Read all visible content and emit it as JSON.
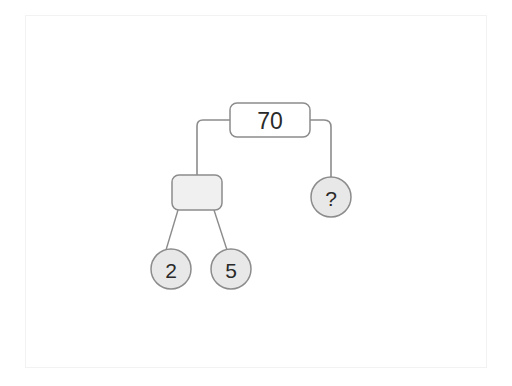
{
  "diagram": {
    "type": "tree-diagram",
    "title_text": "",
    "colors": {
      "page_background": "#ffffff",
      "frame_border": "#f2f2f2",
      "node_stroke": "#8c8c8c",
      "connector_stroke": "#8c8c8c",
      "root_fill": "#ffffff",
      "box_fill": "#f0f0f0",
      "circle_fill": "#e8e8e8",
      "text_color": "#2a2a2a"
    },
    "nodes": {
      "root": {
        "label": "70",
        "shape": "rounded-rectangle",
        "fill": "#ffffff",
        "x": 230,
        "y": 103,
        "width": 80,
        "height": 34
      },
      "operator_box": {
        "label": "",
        "shape": "rounded-rectangle",
        "fill": "#f0f0f0",
        "x": 172,
        "y": 175,
        "width": 50,
        "height": 35
      },
      "unknown": {
        "label": "?",
        "shape": "circle",
        "fill": "#e8e8e8",
        "cx": 331,
        "cy": 197,
        "r": 20
      },
      "leaf_left": {
        "label": "2",
        "shape": "circle",
        "fill": "#e8e8e8",
        "cx": 171,
        "cy": 269,
        "r": 20
      },
      "leaf_right": {
        "label": "5",
        "shape": "circle",
        "fill": "#e8e8e8",
        "cx": 231,
        "cy": 269,
        "r": 20
      }
    },
    "edges": [
      {
        "name": "root-to-operator-box",
        "style": "orthogonal-rounded"
      },
      {
        "name": "root-to-unknown",
        "style": "orthogonal-rounded"
      },
      {
        "name": "operator-box-to-leaf-left",
        "style": "straight"
      },
      {
        "name": "operator-box-to-leaf-right",
        "style": "straight"
      }
    ]
  }
}
